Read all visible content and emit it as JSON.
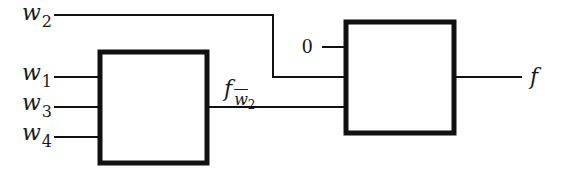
{
  "diagram": {
    "type": "multiplexer-decomposition",
    "colors": {
      "stroke": "#111111",
      "background": "#ffffff",
      "text": "#1a1a1a"
    },
    "inputs": {
      "w2": {
        "base": "w",
        "sub": "2"
      },
      "w1": {
        "base": "w",
        "sub": "1"
      },
      "w3": {
        "base": "w",
        "sub": "3"
      },
      "w4": {
        "base": "w",
        "sub": "4"
      }
    },
    "constant_input": "0",
    "intermediate": {
      "base": "f",
      "sub_var": "w",
      "sub_index": "2",
      "complemented": true
    },
    "output": "f",
    "blocks": [
      {
        "id": "block-1",
        "inputs": [
          "w1",
          "w3",
          "w4"
        ],
        "output": "f_w2bar"
      },
      {
        "id": "block-2",
        "inputs": [
          "0",
          "w2",
          "f_w2bar"
        ],
        "output": "f"
      }
    ]
  }
}
